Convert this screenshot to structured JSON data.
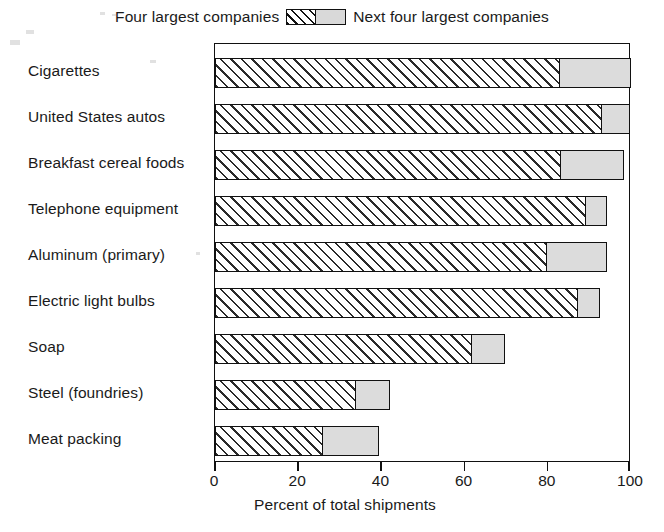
{
  "chart_data": {
    "type": "bar",
    "orientation": "horizontal",
    "stacked": true,
    "title": "",
    "xlabel": "Percent of total shipments",
    "ylabel": "",
    "xlim": [
      0,
      100
    ],
    "xticks": [
      0,
      20,
      40,
      60,
      80,
      100
    ],
    "xticklabels": [
      "0",
      "20",
      "40",
      "60",
      "80",
      "100"
    ],
    "grid": false,
    "legend_position": "top-center",
    "categories": [
      "Cigarettes",
      "United States autos",
      "Breakfast cereal foods",
      "Telephone equipment",
      "Aluminum (primary)",
      "Electric light bulbs",
      "Soap",
      "Steel (foundries)",
      "Meat packing"
    ],
    "series": [
      {
        "name": "Four largest companies",
        "pattern": "diagonal-hatch",
        "values": [
          82.6,
          92.8,
          82.9,
          88.9,
          79.5,
          87.0,
          61.6,
          33.6,
          25.8
        ]
      },
      {
        "name": "Next four largest companies",
        "pattern": "solid-gray",
        "values": [
          17.4,
          7.0,
          15.4,
          5.3,
          14.7,
          5.5,
          8.0,
          8.4,
          13.6
        ]
      }
    ],
    "cumulative_totals": [
      100.0,
      99.8,
      98.3,
      94.2,
      94.2,
      92.5,
      69.6,
      42.0,
      39.4
    ]
  },
  "legend": {
    "left_label": "Four largest companies",
    "right_label": "Next four largest companies",
    "left_swatch_icon": "hatch-swatch-icon",
    "right_swatch_icon": "solid-swatch-icon"
  },
  "axis": {
    "x_title": "Percent of total shipments"
  },
  "colors": {
    "ink": "#111111",
    "hatch_fill": "#ffffff",
    "solid_fill": "#dcdcdc",
    "background": "#ffffff"
  }
}
